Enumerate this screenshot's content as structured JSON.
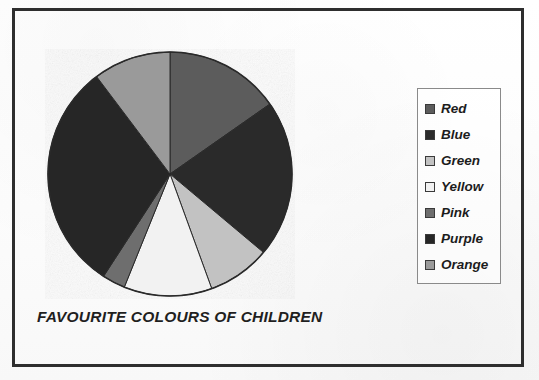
{
  "figure": {
    "caption": "FAVOURITE COLOURS OF CHILDREN",
    "frame_color": "#2e2e2e",
    "background_color": "#fdfdfd"
  },
  "legend": {
    "position": "right",
    "border_color": "#8a8a8a",
    "entries": [
      {
        "label": "Red",
        "swatch": "#5c5c5c"
      },
      {
        "label": "Blue",
        "swatch": "#2b2b2b"
      },
      {
        "label": "Green",
        "swatch": "#c2c2c2"
      },
      {
        "label": "Yellow",
        "swatch": "#f2f2f2"
      },
      {
        "label": "Pink",
        "swatch": "#6e6e6e"
      },
      {
        "label": "Purple",
        "swatch": "#262626"
      },
      {
        "label": "Orange",
        "swatch": "#9a9a9a"
      }
    ]
  },
  "chart_data": {
    "type": "pie",
    "title": "FAVOURITE COLOURS OF CHILDREN",
    "xlabel": "",
    "ylabel": "",
    "categories": [
      "Red",
      "Blue",
      "Green",
      "Yellow",
      "Pink",
      "Purple",
      "Orange"
    ],
    "values": [
      55,
      75,
      30,
      42,
      11,
      110,
      37
    ],
    "value_unit": "degrees",
    "percentages": [
      15.3,
      20.8,
      8.3,
      11.7,
      3.1,
      30.6,
      10.3
    ],
    "colors": [
      "#5c5c5c",
      "#2b2b2b",
      "#c2c2c2",
      "#f2f2f2",
      "#6e6e6e",
      "#262626",
      "#9a9a9a"
    ],
    "start_angle_deg": 0,
    "direction": "clockwise",
    "center_px": [
      169,
      173
    ],
    "radius_px": 124,
    "grid": false,
    "legend_position": "right"
  }
}
